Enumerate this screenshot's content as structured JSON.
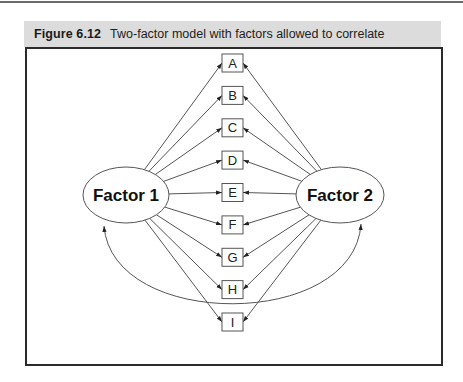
{
  "figure": {
    "number": "Figure 6.12",
    "caption": "Two-factor model with factors allowed to correlate"
  },
  "diagram": {
    "factors": [
      {
        "id": "f1",
        "label": "Factor 1"
      },
      {
        "id": "f2",
        "label": "Factor 2"
      }
    ],
    "indicators": [
      "A",
      "B",
      "C",
      "D",
      "E",
      "F",
      "G",
      "H",
      "I"
    ],
    "paths": {
      "f1": [
        "A",
        "B",
        "C",
        "D",
        "E",
        "F",
        "G",
        "H",
        "I"
      ],
      "f2": [
        "A",
        "B",
        "C",
        "D",
        "E",
        "F",
        "G",
        "H",
        "I"
      ]
    },
    "correlation": {
      "from": "f1",
      "to": "f2",
      "type": "double-headed-curve"
    },
    "colors": {
      "line": "#555555",
      "caption_bg": "#dcdcdc",
      "frame": "#2a2a2a"
    }
  }
}
